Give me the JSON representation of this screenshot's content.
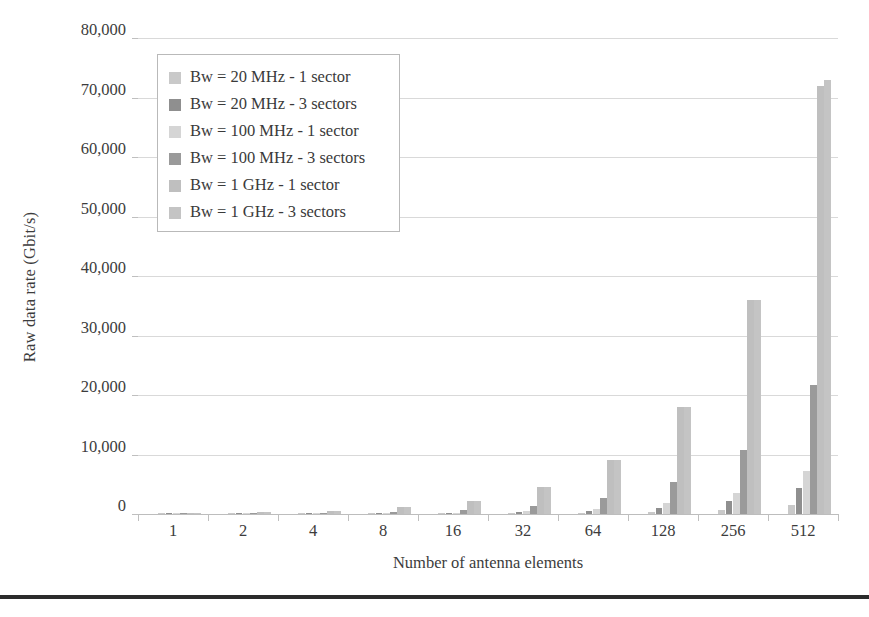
{
  "chart_data": {
    "type": "bar",
    "title": "",
    "xlabel": "Number of antenna elements",
    "ylabel": "Raw data rate (Gbit/s)",
    "categories": [
      "1",
      "2",
      "4",
      "8",
      "16",
      "32",
      "64",
      "128",
      "256",
      "512"
    ],
    "ylim": [
      0,
      80000
    ],
    "ytick_labels": [
      "0",
      "10,000",
      "20,000",
      "30,000",
      "40,000",
      "50,000",
      "60,000",
      "70,000",
      "80,000"
    ],
    "ytick_values": [
      0,
      10000,
      20000,
      30000,
      40000,
      50000,
      60000,
      70000,
      80000
    ],
    "grid": true,
    "legend_position": "upper-left-inside",
    "series": [
      {
        "name": "Bw = 20 MHz - 1 sector",
        "color": "#c9c9c9",
        "values": [
          2.8,
          5.6,
          11.3,
          22.5,
          45,
          90,
          180,
          360,
          720,
          1440
        ]
      },
      {
        "name": "Bw = 20 MHz - 3 sectors",
        "color": "#8f8f8f",
        "values": [
          8.4,
          16.9,
          33.8,
          67.5,
          135,
          270,
          540,
          1080,
          2160,
          4320
        ]
      },
      {
        "name": "Bw = 100 MHz - 1 sector",
        "color": "#d5d5d5",
        "values": [
          14,
          28,
          56,
          113,
          225,
          450,
          900,
          1800,
          3600,
          7200
        ]
      },
      {
        "name": "Bw = 100 MHz - 3 sectors",
        "color": "#9a9a9a",
        "values": [
          42,
          85,
          169,
          338,
          675,
          1350,
          2700,
          5400,
          10800,
          21600
        ]
      },
      {
        "name": "Bw = 1 GHz - 1 sector",
        "color": "#bfbfbf",
        "values": [
          141,
          282,
          563,
          1125,
          2250,
          4500,
          9000,
          18000,
          36000,
          72000
        ]
      },
      {
        "name": "Bw = 1 GHz - 3 sectors",
        "color": "#c4c4c4",
        "values": [
          141,
          282,
          563,
          1125,
          2250,
          4500,
          9000,
          18000,
          36000,
          73000
        ]
      }
    ]
  },
  "legend": {
    "items": [
      {
        "label": "Bw = 20 MHz - 1 sector"
      },
      {
        "label": "Bw = 20 MHz - 3 sectors"
      },
      {
        "label": "Bw = 100 MHz - 1 sector"
      },
      {
        "label": "Bw = 100 MHz - 3 sectors"
      },
      {
        "label": "Bw = 1 GHz - 1 sector"
      },
      {
        "label": "Bw = 1 GHz - 3 sectors"
      }
    ]
  }
}
